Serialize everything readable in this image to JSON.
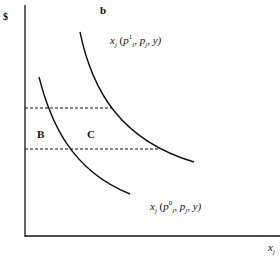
{
  "axes": {
    "y_label": "$",
    "x_label_var": "x",
    "x_label_sub": "j"
  },
  "labels": {
    "top_marker": "b",
    "region_b": "B",
    "region_c": "C"
  },
  "curves": {
    "upper": {
      "fn": "x",
      "fn_sub": "j",
      "open": " (",
      "p": "p",
      "p_sup": "1",
      "p_sub": "i",
      "rest1": ", ",
      "pj": "p",
      "pj_sub": "j",
      "rest2": ", y)"
    },
    "lower": {
      "fn": "x",
      "fn_sub": "j",
      "open": " (",
      "p": "p",
      "p_sup": "0",
      "p_sub": "i",
      "rest1": ", ",
      "pj": "p",
      "pj_sub": "j",
      "rest2": ", y)"
    }
  },
  "colors": {
    "line": "#111111",
    "background": "#ffffff"
  }
}
